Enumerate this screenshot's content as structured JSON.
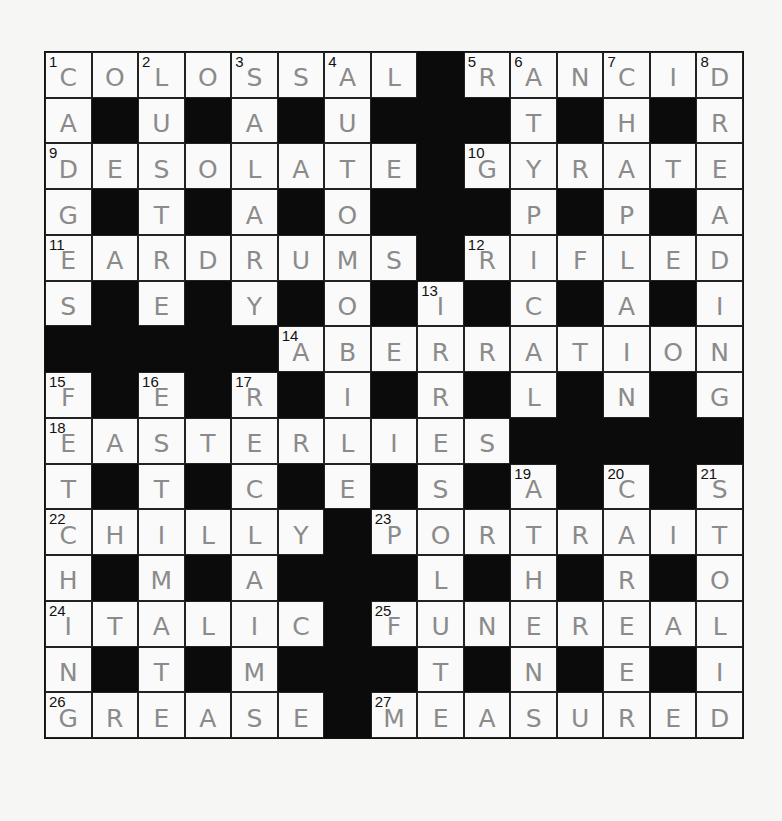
{
  "puzzle": {
    "rows": 15,
    "cols": 15,
    "letter_color": "#8b8b8b",
    "block_color": "#0b0b0b",
    "grid": [
      "COLOSSAL#RANCID",
      "A#U#A#U###T#H#R",
      "DESOLATE#GYRATE",
      "G#T#A#O###P#P#A",
      "EARDRUMS#RIFLED",
      "S#E#Y#O#I#C#A#I",
      "#####ABERRATION",
      "F#E#R#I#R#L#N#G",
      "EASTERLIES#####",
      "T#T#C#E#S#A#C#S",
      "CHILLY#PORTRAIT",
      "H#M#A###L#H#R#O",
      "ITALIC#FUNEREAL",
      "N#T#M###T#N#E#I",
      "GREASE#MEASURED"
    ],
    "numbers": [
      {
        "row": 0,
        "col": 0,
        "n": "1"
      },
      {
        "row": 0,
        "col": 2,
        "n": "2"
      },
      {
        "row": 0,
        "col": 4,
        "n": "3"
      },
      {
        "row": 0,
        "col": 6,
        "n": "4"
      },
      {
        "row": 0,
        "col": 9,
        "n": "5"
      },
      {
        "row": 0,
        "col": 10,
        "n": "6"
      },
      {
        "row": 0,
        "col": 12,
        "n": "7"
      },
      {
        "row": 0,
        "col": 14,
        "n": "8"
      },
      {
        "row": 2,
        "col": 0,
        "n": "9"
      },
      {
        "row": 2,
        "col": 9,
        "n": "10"
      },
      {
        "row": 4,
        "col": 0,
        "n": "11"
      },
      {
        "row": 4,
        "col": 9,
        "n": "12"
      },
      {
        "row": 5,
        "col": 8,
        "n": "13"
      },
      {
        "row": 6,
        "col": 5,
        "n": "14"
      },
      {
        "row": 7,
        "col": 0,
        "n": "15"
      },
      {
        "row": 7,
        "col": 2,
        "n": "16"
      },
      {
        "row": 7,
        "col": 4,
        "n": "17"
      },
      {
        "row": 8,
        "col": 0,
        "n": "18"
      },
      {
        "row": 9,
        "col": 10,
        "n": "19"
      },
      {
        "row": 9,
        "col": 12,
        "n": "20"
      },
      {
        "row": 9,
        "col": 14,
        "n": "21"
      },
      {
        "row": 10,
        "col": 0,
        "n": "22"
      },
      {
        "row": 10,
        "col": 7,
        "n": "23"
      },
      {
        "row": 12,
        "col": 0,
        "n": "24"
      },
      {
        "row": 12,
        "col": 7,
        "n": "25"
      },
      {
        "row": 14,
        "col": 0,
        "n": "26"
      },
      {
        "row": 14,
        "col": 7,
        "n": "27"
      }
    ],
    "across": [
      {
        "n": "1",
        "answer": "COLOSSAL"
      },
      {
        "n": "5",
        "answer": "RANCID"
      },
      {
        "n": "9",
        "answer": "DESOLATE"
      },
      {
        "n": "10",
        "answer": "GYRATE"
      },
      {
        "n": "11",
        "answer": "EARDRUMS"
      },
      {
        "n": "12",
        "answer": "RIFLED"
      },
      {
        "n": "14",
        "answer": "ABERRATION"
      },
      {
        "n": "18",
        "answer": "EASTERLIES"
      },
      {
        "n": "22",
        "answer": "CHILLY"
      },
      {
        "n": "23",
        "answer": "PORTRAIT"
      },
      {
        "n": "24",
        "answer": "ITALIC"
      },
      {
        "n": "25",
        "answer": "FUNEREAL"
      },
      {
        "n": "26",
        "answer": "GREASE"
      },
      {
        "n": "27",
        "answer": "MEASURED"
      }
    ],
    "down": [
      {
        "n": "1",
        "answer": "CADGES"
      },
      {
        "n": "2",
        "answer": "LUSTRE"
      },
      {
        "n": "3",
        "answer": "SALARY"
      },
      {
        "n": "4",
        "answer": "AUTOMOBILE"
      },
      {
        "n": "6",
        "answer": "ATYPICAL"
      },
      {
        "n": "7",
        "answer": "CHAPLAIN"
      },
      {
        "n": "8",
        "answer": "DREADING"
      },
      {
        "n": "13",
        "answer": "IRRESOLUTE"
      },
      {
        "n": "15",
        "answer": "FETCHING"
      },
      {
        "n": "16",
        "answer": "ESTIMATE"
      },
      {
        "n": "17",
        "answer": "RECLAIM"
      },
      {
        "n": "19",
        "answer": "ATHENS"
      },
      {
        "n": "20",
        "answer": "CAREER"
      },
      {
        "n": "21",
        "answer": "STOLID"
      }
    ]
  }
}
